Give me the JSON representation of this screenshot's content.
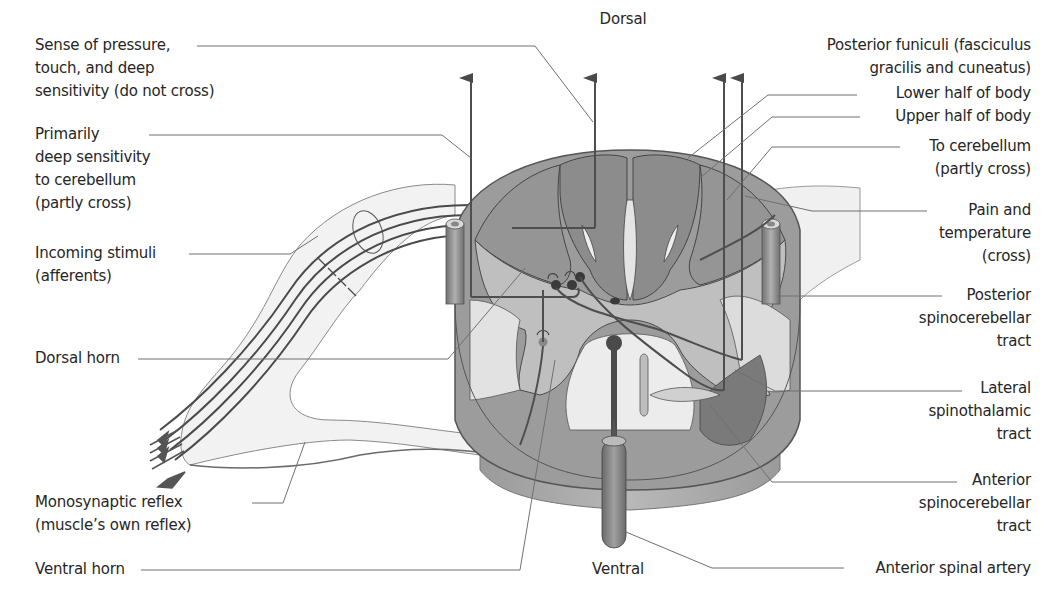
{
  "diagram": {
    "orientation": {
      "top": "Dorsal",
      "bottom": "Ventral"
    },
    "labels_left": [
      {
        "id": "pressure",
        "text": "Sense of pressure,\ntouch, and deep\nsensitivity (do not cross)"
      },
      {
        "id": "deep",
        "text": "Primarily\ndeep sensitivity\nto cerebellum\n(partly cross)"
      },
      {
        "id": "incoming",
        "text": "Incoming stimuli\n(afferents)"
      },
      {
        "id": "dorsal_horn",
        "text": "Dorsal horn"
      },
      {
        "id": "mono",
        "text": "Monosynaptic reflex\n(muscle’s own reflex)"
      },
      {
        "id": "ventral_horn",
        "text": "Ventral horn"
      }
    ],
    "labels_right": [
      {
        "id": "posterior_funiculi",
        "text": "Posterior funiculi (fasciculus\ngracilis and cuneatus)"
      },
      {
        "id": "lower_half",
        "text": "Lower half of body"
      },
      {
        "id": "upper_half",
        "text": "Upper half of body"
      },
      {
        "id": "to_cerebellum",
        "text": "To cerebellum\n(partly cross)"
      },
      {
        "id": "pain",
        "text": "Pain and\ntemperature\n(cross)"
      },
      {
        "id": "post_spinocerebellar",
        "text": "Posterior\nspinocerebellar\ntract"
      },
      {
        "id": "lat_spinothalamic",
        "text": "Lateral\nspinothalamic\ntract"
      },
      {
        "id": "ant_spinocerebellar",
        "text": "Anterior\nspinocerebellar\ntract"
      },
      {
        "id": "ant_spinal_artery",
        "text": "Anterior spinal artery"
      }
    ],
    "colors": {
      "white_matter_dark": "#8a8a8a",
      "white_matter_mid": "#a8a8a8",
      "gray_matter": "#bdbdbd",
      "light_region": "#e2e2e2",
      "pathway_line": "#505050",
      "leader_line": "#6e6e6e",
      "background": "#ffffff"
    }
  }
}
